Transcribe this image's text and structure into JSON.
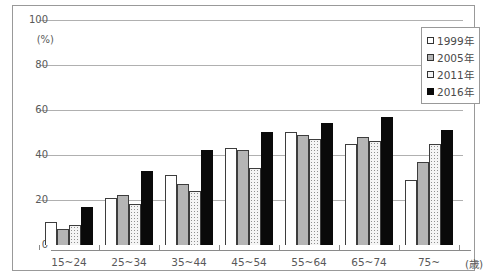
{
  "chart_data": {
    "type": "bar",
    "title": "",
    "ylabel_unit": "(%)",
    "xaxis_suffix": "(歳)",
    "categories": [
      "15~24",
      "25~34",
      "35~44",
      "45~54",
      "55~64",
      "65~74",
      "75~"
    ],
    "series": [
      {
        "name": "1999年",
        "pattern": "white",
        "values": [
          10,
          21,
          31,
          43,
          50,
          45,
          29
        ]
      },
      {
        "name": "2005年",
        "pattern": "gray",
        "values": [
          7,
          22,
          27,
          42,
          49,
          48,
          37
        ]
      },
      {
        "name": "2011年",
        "pattern": "dotted",
        "values": [
          9,
          18,
          24,
          34,
          47,
          46,
          45
        ]
      },
      {
        "name": "2016年",
        "pattern": "black",
        "values": [
          17,
          33,
          42,
          50,
          54,
          57,
          51
        ]
      }
    ],
    "ylim": [
      0,
      100
    ],
    "yticks": [
      0,
      20,
      40,
      60,
      80,
      100
    ],
    "grid": true,
    "legend_position": "top-right"
  },
  "colors": {
    "series_1999": "#ffffff",
    "series_2005": "#b5b5b5",
    "series_2011": "#f4f4f4",
    "series_2016": "#0a0a0a",
    "bar_border": "#3d3d3d",
    "gridline": "#b0b0b0",
    "axis": "#8a8a8a",
    "frame_border": "#999999",
    "label_text": "#595959"
  }
}
